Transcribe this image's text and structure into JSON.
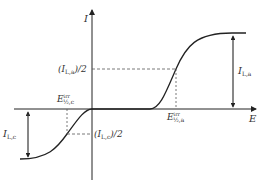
{
  "diagram": {
    "type": "current-potential curve",
    "axes": {
      "x_label": "E",
      "y_label": "I"
    },
    "labels": {
      "anodic_half_current": {
        "main": "(I",
        "sub": "L,a",
        "tail": ")/2"
      },
      "cathodic_half_current": {
        "main": "(I",
        "sub": "L,c",
        "tail": ")/2"
      },
      "anodic_limiting_current": {
        "main": "I",
        "sub": "L,a"
      },
      "cathodic_limiting_current": {
        "main": "I",
        "sub": "L,c"
      },
      "anodic_half_wave_potential": {
        "main": "E",
        "sup": "irr",
        "sub": "½,a"
      },
      "cathodic_half_wave_potential": {
        "main": "E",
        "sup": "irr",
        "sub": "½,c"
      }
    },
    "colors": {
      "line": "#222222",
      "dashed": "#555555",
      "text": "#333333"
    }
  }
}
